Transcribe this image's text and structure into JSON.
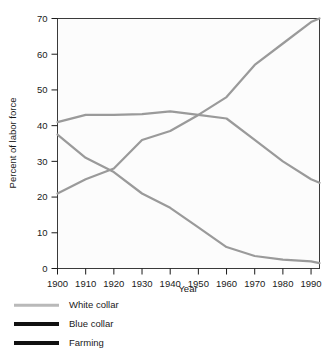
{
  "chart_data": {
    "type": "line",
    "title": "",
    "xlabel": "Year",
    "ylabel": "Percent of labor force",
    "xlim": [
      1900,
      1993
    ],
    "ylim": [
      0,
      70
    ],
    "xticks": [
      1900,
      1910,
      1920,
      1930,
      1940,
      1950,
      1960,
      1970,
      1980,
      1990
    ],
    "yticks": [
      0,
      10,
      20,
      30,
      40,
      50,
      60,
      70
    ],
    "xticklabels": [
      "1900",
      "1910",
      "1920",
      "1930",
      "1940",
      "1950",
      "1960",
      "1970",
      "1980",
      "1990"
    ],
    "yticklabels": [
      "0",
      "10",
      "20",
      "30",
      "40",
      "50",
      "60",
      "70"
    ],
    "grid": false,
    "legend_position": "below-left",
    "x": [
      1900,
      1910,
      1920,
      1930,
      1940,
      1950,
      1960,
      1970,
      1980,
      1990,
      1993
    ],
    "series": [
      {
        "name": "White collar",
        "color": "#9a9a9a",
        "width": 2.2,
        "legend_swatch_color": "#b9b9b9",
        "legend_swatch_height": 2.5,
        "values": [
          21,
          25,
          28,
          36,
          38.5,
          43,
          48,
          57,
          63,
          69,
          70
        ]
      },
      {
        "name": "Blue collar",
        "color": "#9a9a9a",
        "width": 2.2,
        "legend_swatch_color": "#111111",
        "legend_swatch_height": 4,
        "values": [
          41,
          43,
          43,
          43.2,
          44,
          43,
          42,
          36,
          30,
          25,
          24
        ]
      },
      {
        "name": "Farming",
        "color": "#9a9a9a",
        "width": 2.2,
        "legend_swatch_color": "#111111",
        "legend_swatch_height": 4,
        "values": [
          37.5,
          31,
          27,
          21,
          17,
          11.5,
          6,
          3.5,
          2.5,
          2,
          1.5
        ]
      }
    ]
  },
  "legend": {
    "items": [
      {
        "label": "White collar"
      },
      {
        "label": "Blue collar"
      },
      {
        "label": "Farming"
      }
    ]
  },
  "axes": {
    "x_title": "Year",
    "y_title": "Percent of labor force"
  }
}
